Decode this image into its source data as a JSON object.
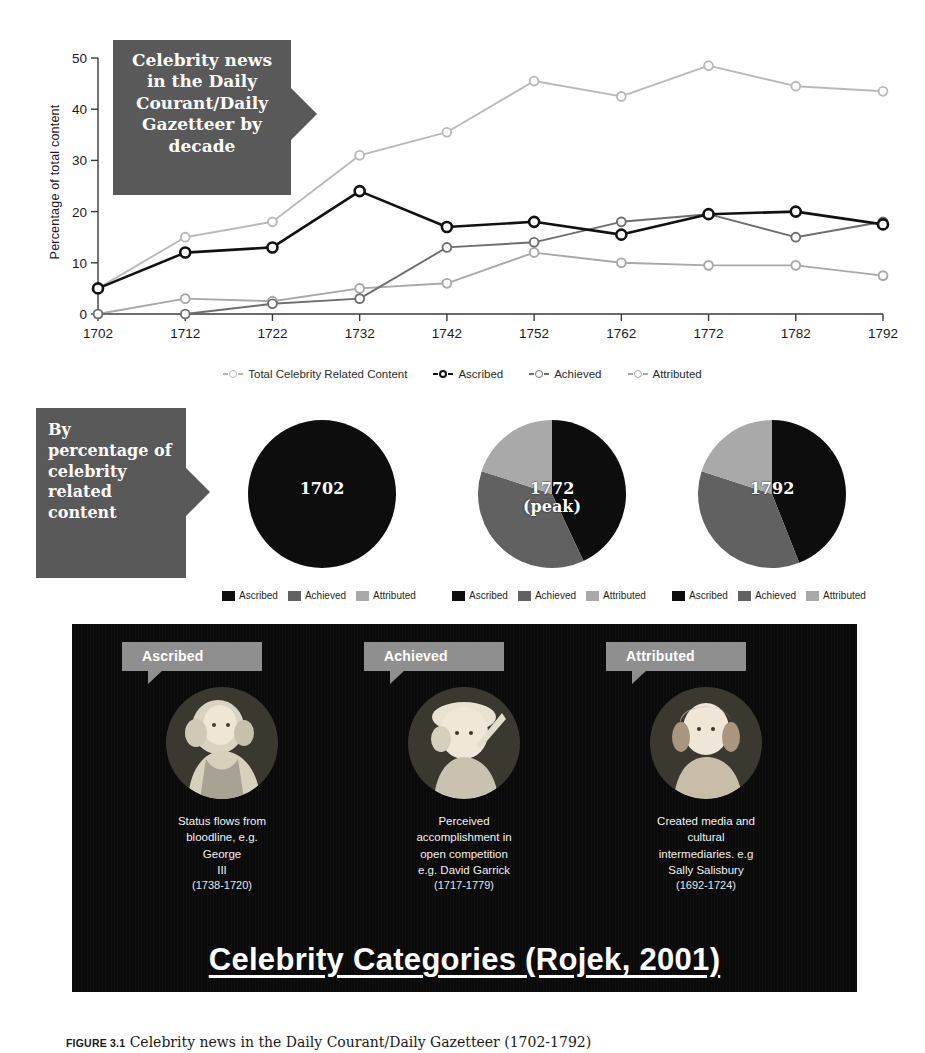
{
  "figure": {
    "number_label": "FIGURE 3.1",
    "caption_text": "Celebrity news in the Daily Courant/Daily Gazetteer (1702-1792)"
  },
  "line_section": {
    "callout": "Celebrity news in the Daily Courant/Daily Gazetteer by decade",
    "y_axis_title": "Percentage of total content",
    "legend": [
      {
        "label": "Total Celebrity Related Content",
        "color": "#b9b9b9",
        "marker": "open-circle"
      },
      {
        "label": "Ascribed",
        "color": "#111111",
        "marker": "open-circle"
      },
      {
        "label": "Achieved",
        "color": "#6e6e6e",
        "marker": "open-circle"
      },
      {
        "label": "Attributed",
        "color": "#a8a8a8",
        "marker": "open-circle"
      }
    ]
  },
  "pie_section": {
    "callout": "By percentage of celebrity related content",
    "legend_labels": {
      "ascribed": "Ascribed",
      "achieved": "Achieved",
      "attributed": "Attributed"
    },
    "colors": {
      "ascribed": "#0d0d0d",
      "achieved": "#616161",
      "attributed": "#a9a9a9"
    },
    "pies": [
      {
        "caption": "1702",
        "caption_line2": "",
        "values": [
          100,
          0,
          0
        ]
      },
      {
        "caption": "1772",
        "caption_line2": "(peak)",
        "values": [
          43,
          37,
          20
        ]
      },
      {
        "caption": "1792",
        "caption_line2": "",
        "values": [
          44,
          36,
          20
        ]
      }
    ]
  },
  "categories_panel": {
    "title": "Celebrity Categories (Rojek, 2001)",
    "items": [
      {
        "tag": "Ascribed",
        "description": "Status flows from\nbloodline, e.g.\nGeorge\nIII",
        "dates": "(1738-1720)",
        "portrait_name": "portrait-george-iii"
      },
      {
        "tag": "Achieved",
        "description": "Perceived\naccomplishment in\nopen competition\ne.g. David Garrick",
        "dates": "(1717-1779)",
        "portrait_name": "portrait-david-garrick"
      },
      {
        "tag": "Attributed",
        "description": "Created media and\ncultural\nintermediaries. e.g\nSally Salisbury",
        "dates": "(1692-1724)",
        "portrait_name": "portrait-sally-salisbury"
      }
    ]
  },
  "chart_data": {
    "type": "line",
    "title": "Celebrity news in the Daily Courant/Daily Gazetteer by decade",
    "xlabel": "",
    "ylabel": "Percentage of total content",
    "x": [
      1702,
      1712,
      1722,
      1732,
      1742,
      1752,
      1762,
      1772,
      1782,
      1792
    ],
    "xtick_labels": [
      "1702",
      "1712",
      "1722",
      "1732",
      "1742",
      "1752",
      "1762",
      "1772",
      "1782",
      "1792"
    ],
    "ylim": [
      0,
      50
    ],
    "ytick_labels": [
      "0",
      "10",
      "20",
      "30",
      "40",
      "50"
    ],
    "grid": false,
    "legend_position": "bottom",
    "series": [
      {
        "name": "Total Celebrity Related Content",
        "color": "#b9b9b9",
        "values": [
          5,
          15,
          18,
          31,
          35.5,
          45.5,
          42.5,
          48.5,
          44.5,
          43.5
        ]
      },
      {
        "name": "Ascribed",
        "color": "#111111",
        "values": [
          5,
          12,
          13,
          24,
          17,
          18,
          15.5,
          19.5,
          20,
          17.5
        ]
      },
      {
        "name": "Achieved",
        "color": "#6e6e6e",
        "values": [
          0,
          0,
          2,
          3,
          13,
          14,
          18,
          19.5,
          15,
          18
        ]
      },
      {
        "name": "Attributed",
        "color": "#a8a8a8",
        "values": [
          0,
          3,
          2.5,
          5,
          6,
          12,
          10,
          9.5,
          9.5,
          7.5
        ]
      }
    ]
  }
}
